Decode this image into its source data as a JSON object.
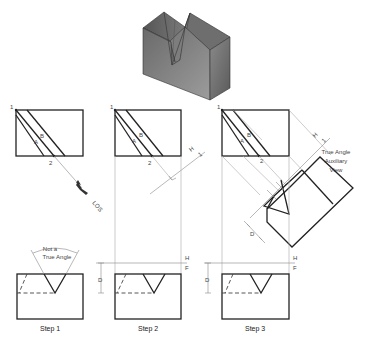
{
  "figure": {
    "iso_view": {
      "description": "Shaded isometric block with V-notch"
    },
    "labels": {
      "point1": "1",
      "point2": "2",
      "lineA": "A",
      "lineB": "B",
      "los": "LOS",
      "H": "H",
      "F": "F",
      "one": "1",
      "D": "D",
      "not_true_angle_line1": "Not a",
      "not_true_angle_line2": "True Angle",
      "aux_line1": "True Angle",
      "aux_line2": "Auxiliary",
      "aux_line3": "View"
    },
    "steps": [
      {
        "label": "Step 1"
      },
      {
        "label": "Step 2"
      },
      {
        "label": "Step 3"
      }
    ],
    "colors": {
      "object_line": "#222222",
      "projection_line": "#aaaaaa",
      "shading_dark": "#4a4a4a",
      "shading_light": "#9a9a9a"
    }
  }
}
